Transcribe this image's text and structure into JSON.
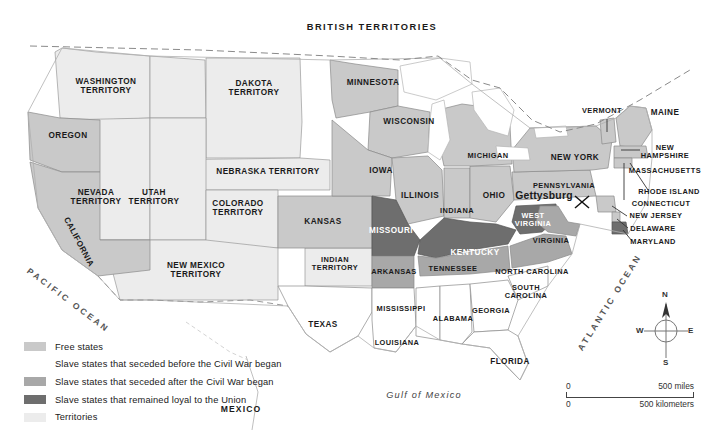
{
  "map": {
    "title": "United States at the Outbreak of the Civil War",
    "north_label": "BRITISH TERRITORIES",
    "south_label": "MEXICO",
    "oceans": {
      "pacific": "PACIFIC OCEAN",
      "atlantic": "ATLANTIC OCEAN",
      "gulf": "Gulf of Mexico"
    },
    "battle": {
      "name": "Gettysburg",
      "marker": "crossed-swords"
    }
  },
  "colors": {
    "free_states": "#c9c9c9",
    "seceded_before": "#ffffff",
    "seceded_after": "#a8a8a8",
    "loyal_slave": "#6e6e6e",
    "territories": "#ececec",
    "water": "#ffffff",
    "border": "#8a8a8a",
    "text": "#1a1a1a"
  },
  "legend": {
    "items": [
      {
        "label": "Free states",
        "swatch": "#c9c9c9"
      },
      {
        "label": "Slave states that seceded before the Civil War began",
        "swatch": "#ffffff"
      },
      {
        "label": "Slave states that seceded after the Civil War began",
        "swatch": "#a8a8a8"
      },
      {
        "label": "Slave states that remained loyal to the Union",
        "swatch": "#6e6e6e"
      },
      {
        "label": "Territories",
        "swatch": "#ececec"
      }
    ]
  },
  "scale": {
    "miles_zero": "0",
    "miles_max": "500 miles",
    "km_zero": "0",
    "km_max": "500 kilometers"
  },
  "compass": {
    "n": "N",
    "e": "E",
    "s": "S",
    "w": "W"
  },
  "places": {
    "free_states": [
      {
        "name": "OREGON",
        "x": 68,
        "y": 136
      },
      {
        "name": "CALIFORNIA",
        "x": 78,
        "y": 243,
        "rotate": -62
      },
      {
        "name": "KANSAS",
        "x": 323,
        "y": 222
      },
      {
        "name": "MINNESOTA",
        "x": 373,
        "y": 83
      },
      {
        "name": "WISCONSIN",
        "x": 409,
        "y": 122
      },
      {
        "name": "IOWA",
        "x": 381,
        "y": 171
      },
      {
        "name": "ILLINOIS",
        "x": 420,
        "y": 196
      },
      {
        "name": "MICHIGAN",
        "x": 488,
        "y": 155
      },
      {
        "name": "INDIANA",
        "x": 457,
        "y": 210
      },
      {
        "name": "OHIO",
        "x": 494,
        "y": 196
      },
      {
        "name": "PENNSYLVANIA",
        "x": 564,
        "y": 185
      },
      {
        "name": "NEW YORK",
        "x": 575,
        "y": 158
      },
      {
        "name": "VERMONT",
        "x": 601,
        "y": 111
      },
      {
        "name": "MAINE",
        "x": 665,
        "y": 113
      },
      {
        "name": "NEW\nHAMPSHIRE",
        "x": 664,
        "y": 152
      },
      {
        "name": "MASSACHUSETTS",
        "x": 664,
        "y": 170
      },
      {
        "name": "RHODE ISLAND",
        "x": 668,
        "y": 191
      },
      {
        "name": "CONNECTICUT",
        "x": 660,
        "y": 203
      },
      {
        "name": "NEW JERSEY",
        "x": 655,
        "y": 215
      },
      {
        "name": "DELAWARE",
        "x": 652,
        "y": 228
      }
    ],
    "territories": [
      {
        "name": "WASHINGTON\nTERRITORY",
        "x": 105,
        "y": 88
      },
      {
        "name": "DAKOTA\nTERRITORY",
        "x": 254,
        "y": 90
      },
      {
        "name": "NEBRASKA TERRITORY",
        "x": 268,
        "y": 172
      },
      {
        "name": "NEVADA\nTERRITORY",
        "x": 96,
        "y": 199
      },
      {
        "name": "UTAH\nTERRITORY",
        "x": 154,
        "y": 199
      },
      {
        "name": "COLORADO\nTERRITORY",
        "x": 238,
        "y": 210
      },
      {
        "name": "NEW MEXICO\nTERRITORY",
        "x": 196,
        "y": 272
      },
      {
        "name": "INDIAN\nTERRITORY",
        "x": 335,
        "y": 265
      }
    ],
    "seceded_before": [
      {
        "name": "TEXAS",
        "x": 323,
        "y": 325
      },
      {
        "name": "LOUISIANA",
        "x": 397,
        "y": 342
      },
      {
        "name": "MISSISSIPPI",
        "x": 400,
        "y": 308
      },
      {
        "name": "ALABAMA",
        "x": 452,
        "y": 318
      },
      {
        "name": "GEORGIA",
        "x": 490,
        "y": 310
      },
      {
        "name": "FLORIDA",
        "x": 509,
        "y": 362
      },
      {
        "name": "SOUTH\nCAROLINA",
        "x": 525,
        "y": 291
      }
    ],
    "seceded_after": [
      {
        "name": "ARKANSAS",
        "x": 393,
        "y": 271
      },
      {
        "name": "TENNESSEE",
        "x": 452,
        "y": 268
      },
      {
        "name": "NORTH CAROLINA",
        "x": 530,
        "y": 271
      },
      {
        "name": "VIRGINIA",
        "x": 550,
        "y": 240
      }
    ],
    "loyal_slave": [
      {
        "name": "MISSOURI",
        "x": 390,
        "y": 231
      },
      {
        "name": "KENTUCKY",
        "x": 474,
        "y": 253
      },
      {
        "name": "WEST\nVIRGINIA",
        "x": 532,
        "y": 219
      },
      {
        "name": "MARYLAND",
        "x": 652,
        "y": 241
      }
    ]
  }
}
